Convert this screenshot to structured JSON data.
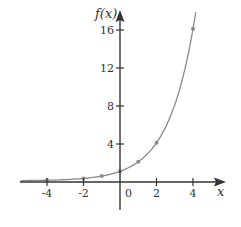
{
  "chart_data": {
    "type": "line",
    "title": "",
    "function": "f(x) = 2^x",
    "xlabel": "x",
    "ylabel": "f(x)",
    "x_ticks": [
      -4,
      -2,
      0,
      2,
      4
    ],
    "y_ticks": [
      4,
      8,
      12,
      16
    ],
    "x_tick_labels": [
      "-4",
      "-2",
      "0",
      "2",
      "4"
    ],
    "y_tick_labels": [
      "4",
      "8",
      "12",
      "16"
    ],
    "xlim": [
      -5.5,
      5.8
    ],
    "ylim": [
      -3,
      17.5
    ],
    "grid": false,
    "legend": null,
    "series": [
      {
        "name": "f(x)",
        "x": [
          -4,
          -2,
          -1,
          0,
          1,
          2,
          4
        ],
        "y": [
          0.0625,
          0.25,
          0.5,
          1,
          2,
          4,
          16
        ],
        "markers": true
      }
    ],
    "colors": {
      "curve": "#8a8a8a",
      "axis": "#333333"
    }
  }
}
